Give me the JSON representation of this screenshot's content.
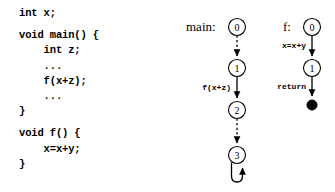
{
  "code": {
    "lines": [
      "int x;",
      "",
      "void main() {",
      "    int z;",
      "    ...",
      "    f(x+z);",
      "    ...",
      "}",
      "",
      "void f() {",
      "    x=x+y;",
      "}"
    ]
  },
  "graphs": {
    "main": {
      "caption": "main:",
      "nodes": [
        {
          "id": "main-0",
          "label": "0",
          "cx": 237,
          "cy": 27,
          "r": 8.5,
          "kind": "circle"
        },
        {
          "id": "main-1",
          "label": "1",
          "cx": 237,
          "cy": 68,
          "r": 8.5,
          "kind": "circle"
        },
        {
          "id": "main-2",
          "label": "2",
          "cx": 237,
          "cy": 110,
          "r": 8.5,
          "kind": "circle"
        },
        {
          "id": "main-3",
          "label": "3",
          "cx": 237,
          "cy": 155,
          "r": 8.5,
          "kind": "circle"
        }
      ],
      "edges": [
        {
          "id": "main-e0",
          "from": "main-0",
          "to": "main-1",
          "style": "dashed",
          "label": ""
        },
        {
          "id": "main-e1",
          "from": "main-1",
          "to": "main-2",
          "style": "solid",
          "label": "f(x+z)"
        },
        {
          "id": "main-e2",
          "from": "main-2",
          "to": "main-3",
          "style": "dashed",
          "label": ""
        },
        {
          "id": "main-e3",
          "from": "main-3",
          "to": "main-3",
          "style": "solid",
          "label": ""
        }
      ]
    },
    "f": {
      "caption": "f:",
      "nodes": [
        {
          "id": "f-0",
          "label": "0",
          "cx": 312,
          "cy": 27,
          "r": 8.5,
          "kind": "circle"
        },
        {
          "id": "f-1",
          "label": "1",
          "cx": 312,
          "cy": 68,
          "r": 8.5,
          "kind": "circle"
        },
        {
          "id": "f-exit",
          "label": "",
          "cx": 312,
          "cy": 105,
          "r": 5,
          "kind": "terminal"
        }
      ],
      "edges": [
        {
          "id": "f-e0",
          "from": "f-0",
          "to": "f-1",
          "style": "solid",
          "label": "x=x+y"
        },
        {
          "id": "f-e1",
          "from": "f-1",
          "to": "f-exit",
          "style": "solid",
          "label": "return"
        }
      ]
    }
  },
  "labels": {
    "main_node_0": "0",
    "main_node_1": "1",
    "main_node_2": "2",
    "main_node_3": "3",
    "main_edge_call": "f(x+z)",
    "f_node_0": "0",
    "f_node_1": "1",
    "f_edge_assign": "x=x+y",
    "f_edge_return": "return",
    "caption_main": "main:",
    "caption_f": "f:"
  },
  "colors": {
    "background": "#ffffff",
    "ink": "#000000"
  }
}
